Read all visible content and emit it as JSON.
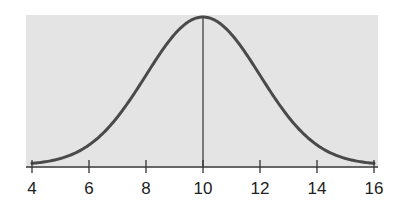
{
  "chart_data": {
    "type": "line",
    "title": "",
    "xlabel": "",
    "ylabel": "",
    "distribution": {
      "mean": 10,
      "sd": 2
    },
    "xlim": [
      4,
      16
    ],
    "x_ticks": [
      4,
      6,
      8,
      10,
      12,
      14,
      16
    ],
    "x_tick_labels": [
      "4",
      "6",
      "8",
      "10",
      "12",
      "14",
      "16"
    ],
    "y_axis_visible": false,
    "grid": false,
    "legend": null,
    "annotations": [
      {
        "type": "vertical-line",
        "x": 10,
        "label": "mean"
      }
    ],
    "series": [
      {
        "name": "normal-density",
        "x": [
          4,
          5,
          6,
          7,
          8,
          9,
          10,
          11,
          12,
          13,
          14,
          15,
          16
        ],
        "values": [
          0.0022,
          0.0088,
          0.027,
          0.0648,
          0.121,
          0.176,
          0.1995,
          0.176,
          0.121,
          0.0648,
          0.027,
          0.0088,
          0.0022
        ]
      }
    ]
  },
  "colors": {
    "plot_background": "#e4e4e4",
    "curve": "#4a4a4a",
    "axis": "#333333",
    "mean_line": "#333333",
    "text": "#222222"
  }
}
